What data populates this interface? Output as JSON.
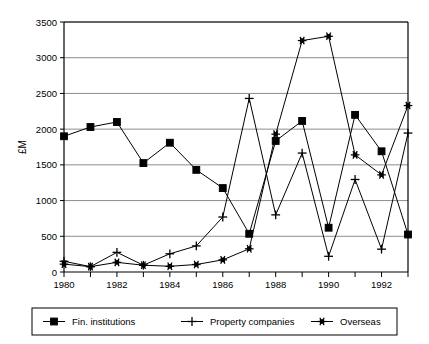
{
  "chart_data": {
    "type": "line",
    "title": "",
    "xlabel": "",
    "ylabel": "£M",
    "xlim": [
      1980,
      1993
    ],
    "ylim": [
      0,
      3500
    ],
    "ytick_step": 500,
    "yticks": [
      "0",
      "500",
      "1000",
      "1500",
      "2000",
      "2500",
      "3000",
      "3500"
    ],
    "xticks_all": [
      1980,
      1981,
      1982,
      1983,
      1984,
      1985,
      1986,
      1987,
      1988,
      1989,
      1990,
      1991,
      1992,
      1993
    ],
    "xtick_labels": [
      "1980",
      "",
      "1982",
      "",
      "1984",
      "",
      "1986",
      "",
      "1988",
      "",
      "1990",
      "",
      "1992",
      ""
    ],
    "grid": "horizontal",
    "legend_position": "bottom",
    "x": [
      1980,
      1981,
      1982,
      1983,
      1984,
      1985,
      1986,
      1987,
      1988,
      1989,
      1990,
      1991,
      1992,
      1993
    ],
    "series": [
      {
        "name": "Fin. institutions",
        "marker": "square",
        "color": "#000000",
        "values": [
          1900,
          2030,
          2100,
          1525,
          1810,
          1430,
          1175,
          535,
          1835,
          2115,
          620,
          2200,
          1690,
          525
        ]
      },
      {
        "name": "Property companies",
        "marker": "plus",
        "color": "#000000",
        "values": [
          150,
          75,
          275,
          95,
          255,
          365,
          770,
          2430,
          800,
          1665,
          220,
          1295,
          320,
          1945
        ]
      },
      {
        "name": "Overseas",
        "marker": "star",
        "color": "#000000",
        "values": [
          110,
          75,
          135,
          95,
          80,
          105,
          170,
          325,
          1930,
          3240,
          3300,
          1640,
          1360,
          2330
        ]
      }
    ]
  },
  "legend": {
    "items": [
      {
        "label": "Fin. institutions",
        "marker": "square"
      },
      {
        "label": "Property companies",
        "marker": "plus"
      },
      {
        "label": "Overseas",
        "marker": "star"
      }
    ]
  }
}
